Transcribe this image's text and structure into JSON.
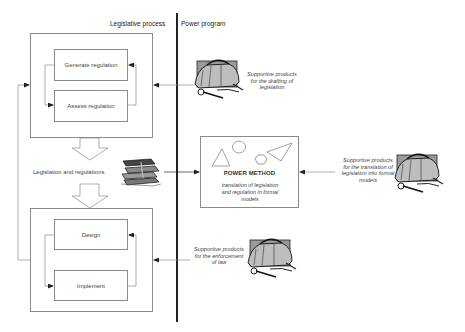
{
  "headers": {
    "legislative_process": "Legislative process",
    "power_program": "Power program"
  },
  "legislative_process": {
    "upper_cycle": {
      "steps": [
        {
          "label": "Generate regulation"
        },
        {
          "label": "Assess regulation"
        }
      ]
    },
    "intermediate_output": "Legislation and regulations",
    "lower_cycle": {
      "steps": [
        {
          "label": "Design"
        },
        {
          "label": "Implement"
        }
      ]
    }
  },
  "power_program": {
    "method": {
      "title": "POWER METHOD",
      "description": "translation of legislation and regulation in formal models"
    },
    "supportive_products": [
      {
        "caption": "Supportive products for the drafting of legislation",
        "icon": "toolbag-icon"
      },
      {
        "caption": "Supportive products for the translation of legislation into formal models",
        "icon": "toolbag-icon"
      },
      {
        "caption": "Supportive products for the enforcement of law",
        "icon": "toolbag-icon"
      }
    ]
  },
  "icons": {
    "books": "books-icon",
    "toolbag": "toolbag-icon"
  },
  "colors": {
    "line": "#8a8a8a",
    "divider": "#222222",
    "text": "#333333"
  }
}
